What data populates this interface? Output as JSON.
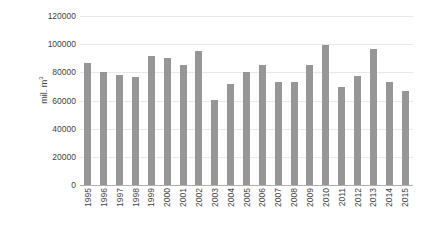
{
  "chart_data": {
    "type": "bar",
    "title": "",
    "xlabel": "",
    "ylabel": "mil. m",
    "ylabel_sup": "3",
    "ylim": [
      0,
      120000
    ],
    "ytick_values": [
      0,
      20000,
      40000,
      60000,
      80000,
      100000,
      120000
    ],
    "ytick_labels": [
      "0",
      "20000",
      "40000",
      "60000",
      "80000",
      "100000",
      "120000"
    ],
    "grid": true,
    "legend": false,
    "bar_color": "#969696",
    "gridline_color": "#e8e8e8",
    "axis_color": "#b0b0b0",
    "text_color": "#3f3f3f",
    "categories": [
      "1995",
      "1996",
      "1997",
      "1998",
      "1999",
      "2000",
      "2001",
      "2002",
      "2003",
      "2004",
      "2005",
      "2006",
      "2007",
      "2008",
      "2009",
      "2010",
      "2011",
      "2012",
      "2013",
      "2014",
      "2015"
    ],
    "values": [
      86500,
      80000,
      78000,
      76500,
      91500,
      90500,
      85500,
      95500,
      60500,
      71500,
      80500,
      85500,
      73500,
      73000,
      85500,
      99500,
      69500,
      77500,
      96500,
      73500,
      67000
    ]
  }
}
